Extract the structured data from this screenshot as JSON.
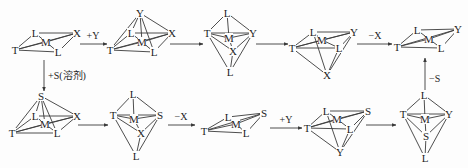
{
  "diagram": {
    "title": "",
    "colors": {
      "ink": "#1e1e1e",
      "line": "#3a3a3a",
      "background": "#fdfdfd"
    },
    "species": [
      {
        "id": "s1",
        "geometry": "square-planar",
        "atoms": [
          {
            "sym": "T",
            "x": 15,
            "y": 50
          },
          {
            "sym": "L",
            "x": 35,
            "y": 33
          },
          {
            "sym": "M",
            "x": 46,
            "y": 42
          },
          {
            "sym": "X",
            "x": 77,
            "y": 33
          },
          {
            "sym": "L",
            "x": 58,
            "y": 52
          }
        ],
        "bonds": [
          [
            0,
            1
          ],
          [
            1,
            3
          ],
          [
            3,
            4
          ],
          [
            4,
            0
          ],
          [
            0,
            2
          ],
          [
            2,
            3
          ],
          [
            1,
            2
          ],
          [
            2,
            4
          ],
          [
            0,
            3
          ]
        ]
      },
      {
        "id": "s2",
        "geometry": "square-pyramidal",
        "atoms": [
          {
            "sym": "Y",
            "x": 140,
            "y": 13
          },
          {
            "sym": "T",
            "x": 110,
            "y": 50
          },
          {
            "sym": "L",
            "x": 131,
            "y": 33
          },
          {
            "sym": "M",
            "x": 142,
            "y": 42
          },
          {
            "sym": "X",
            "x": 172,
            "y": 33
          },
          {
            "sym": "L",
            "x": 154,
            "y": 52
          }
        ],
        "bonds": [
          [
            1,
            2
          ],
          [
            2,
            4
          ],
          [
            4,
            5
          ],
          [
            5,
            1
          ],
          [
            1,
            3
          ],
          [
            3,
            4
          ],
          [
            2,
            3
          ],
          [
            3,
            5
          ],
          [
            1,
            4
          ],
          [
            0,
            1
          ],
          [
            0,
            2
          ],
          [
            0,
            4
          ],
          [
            0,
            5
          ],
          [
            0,
            3
          ]
        ]
      },
      {
        "id": "s3",
        "geometry": "trigonal-bipyramidal",
        "atoms": [
          {
            "sym": "L",
            "x": 227,
            "y": 13
          },
          {
            "sym": "T",
            "x": 207,
            "y": 33
          },
          {
            "sym": "M",
            "x": 229,
            "y": 38
          },
          {
            "sym": "Y",
            "x": 253,
            "y": 33
          },
          {
            "sym": "X",
            "x": 233,
            "y": 51
          },
          {
            "sym": "L",
            "x": 230,
            "y": 72
          }
        ],
        "bonds": [
          [
            0,
            1
          ],
          [
            0,
            3
          ],
          [
            0,
            2
          ],
          [
            1,
            3
          ],
          [
            1,
            2
          ],
          [
            2,
            3
          ],
          [
            1,
            4
          ],
          [
            4,
            3
          ],
          [
            2,
            4
          ],
          [
            1,
            5
          ],
          [
            3,
            5
          ],
          [
            4,
            5
          ]
        ]
      },
      {
        "id": "s4",
        "geometry": "square-pyramidal",
        "atoms": [
          {
            "sym": "L",
            "x": 313,
            "y": 32
          },
          {
            "sym": "T",
            "x": 292,
            "y": 48
          },
          {
            "sym": "M",
            "x": 322,
            "y": 40
          },
          {
            "sym": "Y",
            "x": 354,
            "y": 32
          },
          {
            "sym": "L",
            "x": 339,
            "y": 48
          },
          {
            "sym": "X",
            "x": 327,
            "y": 75
          }
        ],
        "bonds": [
          [
            0,
            3
          ],
          [
            0,
            1
          ],
          [
            1,
            4
          ],
          [
            4,
            3
          ],
          [
            1,
            2
          ],
          [
            2,
            3
          ],
          [
            0,
            2
          ],
          [
            2,
            4
          ],
          [
            1,
            3
          ],
          [
            5,
            1
          ],
          [
            5,
            0
          ],
          [
            5,
            3
          ],
          [
            5,
            4
          ]
        ]
      },
      {
        "id": "s5",
        "geometry": "square-planar",
        "atoms": [
          {
            "sym": "T",
            "x": 397,
            "y": 47
          },
          {
            "sym": "L",
            "x": 417,
            "y": 30
          },
          {
            "sym": "M",
            "x": 429,
            "y": 39
          },
          {
            "sym": "Y",
            "x": 458,
            "y": 29
          },
          {
            "sym": "L",
            "x": 441,
            "y": 48
          }
        ],
        "bonds": [
          [
            0,
            1
          ],
          [
            1,
            3
          ],
          [
            3,
            4
          ],
          [
            4,
            0
          ],
          [
            0,
            2
          ],
          [
            2,
            3
          ],
          [
            1,
            2
          ],
          [
            2,
            4
          ],
          [
            0,
            3
          ]
        ]
      },
      {
        "id": "s6",
        "geometry": "square-pyramidal",
        "atoms": [
          {
            "sym": "S",
            "x": 41,
            "y": 96
          },
          {
            "sym": "T",
            "x": 12,
            "y": 133
          },
          {
            "sym": "L",
            "x": 35,
            "y": 116
          },
          {
            "sym": "M",
            "x": 45,
            "y": 124
          },
          {
            "sym": "X",
            "x": 77,
            "y": 116
          },
          {
            "sym": "L",
            "x": 57,
            "y": 133
          }
        ],
        "bonds": [
          [
            1,
            2
          ],
          [
            2,
            4
          ],
          [
            4,
            5
          ],
          [
            5,
            1
          ],
          [
            1,
            3
          ],
          [
            3,
            4
          ],
          [
            2,
            3
          ],
          [
            3,
            5
          ],
          [
            1,
            4
          ],
          [
            0,
            1
          ],
          [
            0,
            2
          ],
          [
            0,
            4
          ],
          [
            0,
            5
          ],
          [
            0,
            3
          ]
        ]
      },
      {
        "id": "s7",
        "geometry": "trigonal-bipyramidal",
        "atoms": [
          {
            "sym": "L",
            "x": 133,
            "y": 94
          },
          {
            "sym": "T",
            "x": 113,
            "y": 115
          },
          {
            "sym": "M",
            "x": 134,
            "y": 119
          },
          {
            "sym": "S",
            "x": 160,
            "y": 115
          },
          {
            "sym": "X",
            "x": 141,
            "y": 133
          },
          {
            "sym": "L",
            "x": 136,
            "y": 156
          }
        ],
        "bonds": [
          [
            0,
            1
          ],
          [
            0,
            3
          ],
          [
            0,
            2
          ],
          [
            1,
            3
          ],
          [
            1,
            2
          ],
          [
            2,
            3
          ],
          [
            1,
            4
          ],
          [
            4,
            3
          ],
          [
            2,
            4
          ],
          [
            1,
            5
          ],
          [
            3,
            5
          ],
          [
            4,
            5
          ]
        ]
      },
      {
        "id": "s8",
        "geometry": "square-planar",
        "atoms": [
          {
            "sym": "T",
            "x": 204,
            "y": 131
          },
          {
            "sym": "L",
            "x": 228,
            "y": 117
          },
          {
            "sym": "M",
            "x": 236,
            "y": 124
          },
          {
            "sym": "S",
            "x": 264,
            "y": 113
          },
          {
            "sym": "L",
            "x": 246,
            "y": 133
          }
        ],
        "bonds": [
          [
            0,
            1
          ],
          [
            1,
            3
          ],
          [
            3,
            4
          ],
          [
            4,
            0
          ],
          [
            0,
            2
          ],
          [
            2,
            3
          ],
          [
            1,
            2
          ],
          [
            2,
            4
          ],
          [
            0,
            3
          ]
        ]
      },
      {
        "id": "s9",
        "geometry": "square-pyramidal",
        "atoms": [
          {
            "sym": "L",
            "x": 326,
            "y": 111
          },
          {
            "sym": "T",
            "x": 307,
            "y": 128
          },
          {
            "sym": "M",
            "x": 337,
            "y": 119
          },
          {
            "sym": "S",
            "x": 368,
            "y": 111
          },
          {
            "sym": "L",
            "x": 350,
            "y": 129
          },
          {
            "sym": "Y",
            "x": 340,
            "y": 152
          }
        ],
        "bonds": [
          [
            0,
            3
          ],
          [
            0,
            1
          ],
          [
            1,
            4
          ],
          [
            4,
            3
          ],
          [
            1,
            2
          ],
          [
            2,
            3
          ],
          [
            0,
            2
          ],
          [
            2,
            4
          ],
          [
            1,
            3
          ],
          [
            5,
            1
          ],
          [
            5,
            0
          ],
          [
            5,
            3
          ],
          [
            5,
            4
          ]
        ]
      },
      {
        "id": "s10",
        "geometry": "trigonal-bipyramidal",
        "atoms": [
          {
            "sym": "L",
            "x": 424,
            "y": 95
          },
          {
            "sym": "T",
            "x": 403,
            "y": 114
          },
          {
            "sym": "M",
            "x": 425,
            "y": 119
          },
          {
            "sym": "Y",
            "x": 449,
            "y": 114
          },
          {
            "sym": "S",
            "x": 426,
            "y": 136
          },
          {
            "sym": "L",
            "x": 425,
            "y": 158
          }
        ],
        "bonds": [
          [
            0,
            1
          ],
          [
            0,
            3
          ],
          [
            0,
            2
          ],
          [
            1,
            3
          ],
          [
            1,
            2
          ],
          [
            2,
            3
          ],
          [
            1,
            4
          ],
          [
            4,
            3
          ],
          [
            2,
            4
          ],
          [
            1,
            5
          ],
          [
            3,
            5
          ],
          [
            4,
            5
          ]
        ]
      }
    ],
    "arrows": [
      {
        "id": "a1",
        "from": "s1",
        "to": "s2",
        "label": "+Y",
        "x1": 80,
        "y1": 44,
        "x2": 107,
        "y2": 44,
        "lx": 93,
        "ly": 39
      },
      {
        "id": "a2",
        "from": "s2",
        "to": "s3",
        "label": "",
        "x1": 170,
        "y1": 44,
        "x2": 203,
        "y2": 44
      },
      {
        "id": "a3",
        "from": "s3",
        "to": "s4",
        "label": "",
        "x1": 256,
        "y1": 44,
        "x2": 288,
        "y2": 44
      },
      {
        "id": "a4",
        "from": "s4",
        "to": "s5",
        "label": "−X",
        "x1": 357,
        "y1": 44,
        "x2": 392,
        "y2": 44,
        "lx": 375,
        "ly": 39
      },
      {
        "id": "a5",
        "from": "s1",
        "to": "s6",
        "label": "+S(溶剂)",
        "x1": 44,
        "y1": 60,
        "x2": 44,
        "y2": 91,
        "lx": 48,
        "ly": 79,
        "vertical": true
      },
      {
        "id": "a6",
        "from": "s6",
        "to": "s7",
        "label": "",
        "x1": 78,
        "y1": 125,
        "x2": 108,
        "y2": 125
      },
      {
        "id": "a7",
        "from": "s7",
        "to": "s8",
        "label": "−X",
        "x1": 168,
        "y1": 125,
        "x2": 195,
        "y2": 125,
        "lx": 181,
        "ly": 120
      },
      {
        "id": "a8",
        "from": "s8",
        "to": "s9",
        "label": "+Y",
        "x1": 270,
        "y1": 128,
        "x2": 302,
        "y2": 128,
        "lx": 286,
        "ly": 123
      },
      {
        "id": "a9",
        "from": "s9",
        "to": "s10",
        "label": "",
        "x1": 366,
        "y1": 125,
        "x2": 396,
        "y2": 125
      },
      {
        "id": "a10",
        "from": "s10",
        "to": "s5",
        "label": "−S",
        "x1": 425,
        "y1": 92,
        "x2": 425,
        "y2": 58,
        "lx": 429,
        "ly": 82,
        "vertical": true
      }
    ]
  }
}
